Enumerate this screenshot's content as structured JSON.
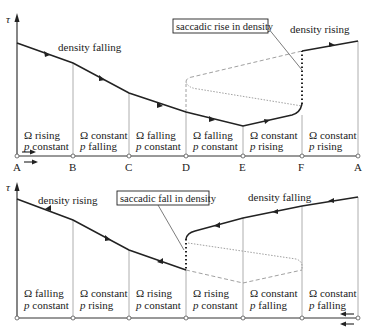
{
  "top_panel": {
    "axis_label": "τ",
    "annotations": {
      "left": "density falling",
      "right": "density rising",
      "box": "saccadic rise in density"
    },
    "points": [
      "A",
      "B",
      "C",
      "D",
      "E",
      "F",
      "A"
    ],
    "regions": [
      {
        "omega": "Ω rising",
        "p_sym": "p",
        "p_text": " constant"
      },
      {
        "omega": "Ω constant",
        "p_sym": "p",
        "p_text": " falling"
      },
      {
        "omega": "Ω falling",
        "p_sym": "p",
        "p_text": " constant"
      },
      {
        "omega": "Ω falling",
        "p_sym": "p",
        "p_text": " constant"
      },
      {
        "omega": "Ω constant",
        "p_sym": "p",
        "p_text": " rising"
      },
      {
        "omega": "Ω constant",
        "p_sym": "p",
        "p_text": " rising"
      }
    ],
    "direction": "left-to-right"
  },
  "bottom_panel": {
    "axis_label": "τ",
    "annotations": {
      "left": "density rising",
      "right": "density falling",
      "box": "saccadic fall in density"
    },
    "regions": [
      {
        "omega": "Ω falling",
        "p_sym": "p",
        "p_text": " constant"
      },
      {
        "omega": "Ω constant",
        "p_sym": "p",
        "p_text": " rising"
      },
      {
        "omega": "Ω rising",
        "p_sym": "p",
        "p_text": " constant"
      },
      {
        "omega": "Ω rising",
        "p_sym": "p",
        "p_text": " constant"
      },
      {
        "omega": "Ω constant",
        "p_sym": "p",
        "p_text": " falling"
      },
      {
        "omega": "Ω constant",
        "p_sym": "p",
        "p_text": " falling"
      }
    ],
    "direction": "right-to-left"
  },
  "colors": {
    "ink": "#222222",
    "grid": "#9a9a9a",
    "dashed": "#888888"
  }
}
